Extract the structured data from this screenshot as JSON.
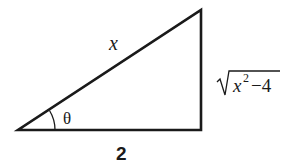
{
  "diagram": {
    "type": "right-triangle",
    "colors": {
      "stroke": "#1a1a1a",
      "background": "#ffffff"
    },
    "vertices": {
      "angle_vertex": [
        18,
        130
      ],
      "right_angle_vertex": [
        201,
        130
      ],
      "top_vertex": [
        201,
        10
      ]
    },
    "labels": {
      "hypotenuse": "x",
      "adjacent": "2",
      "opposite_radicand_var": "x",
      "opposite_exponent": "2",
      "opposite_rest": "−4",
      "angle": "θ"
    }
  }
}
